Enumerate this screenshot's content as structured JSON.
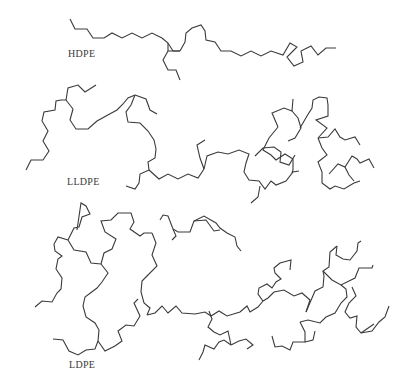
{
  "figure": {
    "stroke_color": "#3a3a3a",
    "background": "#ffffff"
  },
  "labels": {
    "hdpe": "HDPE",
    "lldpe": "LLDPE",
    "ldpe": "LDPE"
  },
  "chains": {
    "hdpe": [
      "70,19 75,29 87,29 93,38 104,38 112,33 122,38 132,33 142,38 152,33 162,38 168,43 173,51 180,51",
      "180,51 185,42 186,33 192,28 201,25 205,31 206,40 215,42 221,51 231,51 241,56 251,51 261,56 271,51 283,55 290,43 297,47 287,57 294,66 303,62 301,51 311,46 318,55 326,48 336,48",
      "168,43 168,51 180,51",
      "168,51 163,60 168,70 176,70 180,80"
    ],
    "lldpe": [
      "26,170 31,160 43,160 49,151 43,141 48,131 42,121 44,112 55,110 56,101 61,100 66,100",
      "66,100 68,88 78,85 85,92 96,85",
      "66,100 73,109 70,120 76,129 88,129 97,121 106,116 117,110 123,104 128,98 135,95",
      "135,95 146,99 150,110 157,114",
      "135,95 131,105 126,112 128,122 140,123 148,131 154,140 156,149 155,158 148,162 149,170",
      "149,170 140,174 139,183 135,189 126,186",
      "149,170 159,179 168,174 178,179 188,174 198,178 204,169",
      "204,169 200,158 197,145 205,140",
      "204,169 207,156 218,152 228,154 239,150 249,154 246,163 244,172 249,180 259,181 265,189 271,181 276,185 286,181 293,172 299,171",
      "255,156 263,148 274,147 281,152 280,162 289,165 295,155",
      "260,186 258,197 251,203",
      "278,127 272,113 284,108 292,111 293,99",
      "278,127 269,138 263,150 271,155 276,160 285,154 293,159 293,170 292,173",
      "292,111 298,118 301,128 295,138 288,141",
      "300,128 307,116 312,108 313,100 319,97 327,98 328,105 328,116 316,120 327,128 318,138",
      "318,138 322,148 327,155 318,162 322,172 322,183 330,189 335,186 344,189 354,183 360,181",
      "318,138 328,137 335,129 340,137 345,140 355,137 360,145",
      "329,174 338,164 345,167 352,156 357,159 360,163 369,159 374,168",
      "345,167 349,175 354,181"
    ],
    "ldpe": [
      "35,307 42,301 52,302 57,293 61,289 62,278 56,269 58,259 62,256 55,251 54,244 58,237 68,240",
      "68,240 74,228 79,227 82,217 90,214 86,206 81,203 77,230",
      "68,240 74,250 86,252 91,263 101,264",
      "101,264 104,253 112,249 116,239 105,232 101,221 111,220 118,213 131,213 134,222 130,229 140,236 144,233 152,233",
      "101,264 108,273 102,282 97,288 85,297 83,306 86,317 95,323 99,330 98,341",
      "98,341 105,351 115,346 122,341 118,331 126,325 134,326 140,316 134,303 138,299",
      "98,341 95,349 86,350 78,355 69,351 63,340 53,339",
      "152,233 156,243 152,255 157,266 147,276 142,281 141,292 144,303 150,308 147,315",
      "147,315 155,313 162,306 168,313 176,306 182,313 195,314",
      "160,220 163,215 168,216 173,229 178,232 190,232 194,221 206,220 214,231 220,230",
      "173,229 176,236 172,240",
      "194,221 204,216 216,223 220,228 227,233 235,237 237,246 241,251",
      "195,314 205,312 211,316 219,311 227,316 240,312 247,306 250,312 258,307 263,301",
      "263,301 258,294 259,288 267,284 272,288 276,282 281,279 275,273 274,268 280,263 291,260 290,270",
      "263,301 268,298 274,292 284,290 294,296 302,293 310,300 306,312",
      "209,311 212,319 208,327 214,332 220,335 228,331 231,345",
      "231,345 224,340 219,342 214,349 205,345 203,352 199,360",
      "231,345 239,341 246,339 253,345 247,349",
      "306,312 312,298 315,291 323,287 324,276 323,271 329,267 330,252 337,246",
      "323,271 332,280 341,285 355,278 359,268 372,268 373,265",
      "337,246 336,255 343,259 350,260 357,251 358,243 361,241",
      "341,285 346,289 347,297 341,303 335,313 326,317 320,323 308,320 300,322",
      "300,322 305,332 305,342 293,342 290,350 282,346 275,347 272,336",
      "305,342 313,340 315,331",
      "352,287 356,296 349,303 345,312 350,318 357,316 356,327 361,333 372,331 379,322 385,317 389,306",
      "361,333 374,324"
    ]
  }
}
